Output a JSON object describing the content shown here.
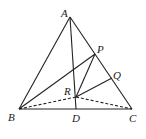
{
  "diagram": {
    "type": "geometry",
    "points": {
      "A": {
        "label": "A",
        "x": 70,
        "y": 17
      },
      "B": {
        "label": "B",
        "x": 19,
        "y": 109
      },
      "C": {
        "label": "C",
        "x": 132,
        "y": 109
      },
      "D": {
        "label": "D",
        "x": 76,
        "y": 109
      },
      "P": {
        "label": "P",
        "x": 95,
        "y": 54
      },
      "Q": {
        "label": "Q",
        "x": 112,
        "y": 78
      },
      "R": {
        "label": "R",
        "x": 76,
        "y": 97
      }
    },
    "solid_segments": [
      "AB",
      "AC",
      "BC",
      "AD",
      "BP",
      "PR",
      "RQ"
    ],
    "dashed_segments": [
      "BR",
      "RC"
    ],
    "stroke_color": "#222222"
  }
}
